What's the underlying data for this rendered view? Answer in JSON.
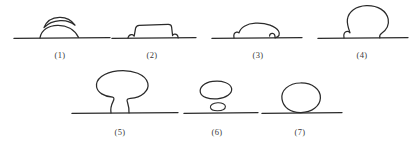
{
  "figure": {
    "type": "line-drawing",
    "stroke_color": "#2b2b2b",
    "background_color": "#ffffff",
    "label_color": "#3a3a3a",
    "rows": [
      {
        "row_index": 1,
        "baseline_y": 38,
        "items": [
          {
            "id": "panel-1",
            "label": "(1)",
            "label_x": 60,
            "label_y": 54,
            "shape": "low flat dome on line with separate crescent arc above",
            "baseline": {
              "x1": 14,
              "x2": 110
            },
            "center_x": 60
          },
          {
            "id": "panel-2",
            "label": "(2)",
            "label_x": 152,
            "label_y": 54,
            "shape": "low flat-topped trapezoid with notched base corners",
            "baseline": {
              "x1": 112,
              "x2": 196
            },
            "center_x": 152
          },
          {
            "id": "panel-3",
            "label": "(3)",
            "label_x": 258,
            "label_y": 54,
            "shape": "flattened oval cap with narrow necks at the line",
            "baseline": {
              "x1": 212,
              "x2": 302
            },
            "center_x": 258
          },
          {
            "id": "panel-4",
            "label": "(4)",
            "label_x": 362,
            "label_y": 54,
            "shape": "tall bulbous balloon with narrow neck on the line",
            "baseline": {
              "x1": 318,
              "x2": 408
            },
            "center_x": 362
          }
        ]
      },
      {
        "row_index": 2,
        "baseline_y": 113,
        "items": [
          {
            "id": "panel-5",
            "label": "(5)",
            "label_x": 120,
            "label_y": 131,
            "shape": "mushroom / tree shape with thin stem on the line",
            "baseline": {
              "x1": 72,
              "x2": 178
            },
            "center_x": 120
          },
          {
            "id": "panel-6",
            "label": "(6)",
            "label_x": 217,
            "label_y": 131,
            "shape": "detached rounded blob above the line plus small flat ellipse on the line",
            "baseline": {
              "x1": 184,
              "x2": 258
            },
            "center_x": 217
          },
          {
            "id": "panel-7",
            "label": "(7)",
            "label_x": 300,
            "label_y": 131,
            "shape": "full ellipse resting tangent on the line",
            "baseline": {
              "x1": 262,
              "x2": 342
            },
            "center_x": 300
          }
        ]
      }
    ]
  }
}
